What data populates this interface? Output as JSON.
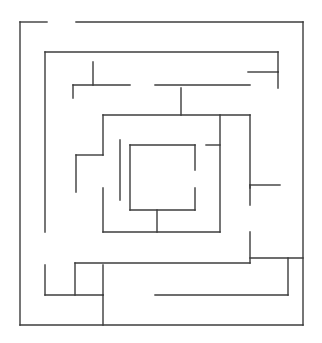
{
  "canvas": {
    "width": 322,
    "height": 343,
    "background_color": "#ffffff"
  },
  "maze": {
    "title": "Square spiral maze",
    "line_color": "#3c3c3c",
    "line_width": 1.4,
    "entrance_gap": {
      "edge": "top",
      "from_x": 47,
      "to_x": 76
    },
    "exit_gap": {
      "edge": "right",
      "from_y": 258,
      "to_y": 283
    },
    "bounds": {
      "left": 20,
      "top": 22,
      "right": 303,
      "bottom": 325
    },
    "ring_count": 5,
    "walls": [
      {
        "id": "outer-top-left",
        "x1": 20,
        "y1": 22,
        "x2": 47,
        "y2": 22
      },
      {
        "id": "outer-top-right",
        "x1": 76,
        "y1": 22,
        "x2": 303,
        "y2": 22
      },
      {
        "id": "outer-left",
        "x1": 20,
        "y1": 22,
        "x2": 20,
        "y2": 325
      },
      {
        "id": "outer-right",
        "x1": 303,
        "y1": 22,
        "x2": 303,
        "y2": 325
      },
      {
        "id": "outer-bottom",
        "x1": 20,
        "y1": 325,
        "x2": 303,
        "y2": 325
      },
      {
        "id": "r1-top",
        "x1": 45,
        "y1": 52,
        "x2": 278,
        "y2": 52
      },
      {
        "id": "r1-left-upper",
        "x1": 45,
        "y1": 52,
        "x2": 45,
        "y2": 232
      },
      {
        "id": "r1-left-lower",
        "x1": 45,
        "y1": 265,
        "x2": 45,
        "y2": 295
      },
      {
        "id": "r1-bottom-left",
        "x1": 45,
        "y1": 295,
        "x2": 103,
        "y2": 295
      },
      {
        "id": "r1-bottom-right",
        "x1": 155,
        "y1": 295,
        "x2": 288,
        "y2": 295
      },
      {
        "id": "r1-right-upper",
        "x1": 278,
        "y1": 52,
        "x2": 278,
        "y2": 72
      },
      {
        "id": "r1-right-stub-h",
        "x1": 248,
        "y1": 72,
        "x2": 278,
        "y2": 72
      },
      {
        "id": "r1-right-stub-v",
        "x1": 278,
        "y1": 72,
        "x2": 278,
        "y2": 88
      },
      {
        "id": "r1-right-mid",
        "x1": 288,
        "y1": 258,
        "x2": 288,
        "y2": 295
      },
      {
        "id": "r1-right-conn",
        "x1": 250,
        "y1": 258,
        "x2": 303,
        "y2": 258
      },
      {
        "id": "r2-top",
        "x1": 73,
        "y1": 85,
        "x2": 130,
        "y2": 85
      },
      {
        "id": "r2-top-stub-v",
        "x1": 93,
        "y1": 62,
        "x2": 93,
        "y2": 85
      },
      {
        "id": "r2-top-left-v",
        "x1": 73,
        "y1": 85,
        "x2": 73,
        "y2": 98
      },
      {
        "id": "r2-top-right",
        "x1": 155,
        "y1": 85,
        "x2": 250,
        "y2": 85
      },
      {
        "id": "r2-upper-h",
        "x1": 103,
        "y1": 115,
        "x2": 250,
        "y2": 115
      },
      {
        "id": "r2-right-v",
        "x1": 250,
        "y1": 115,
        "x2": 250,
        "y2": 188
      },
      {
        "id": "r2-mid-v",
        "x1": 181,
        "y1": 88,
        "x2": 181,
        "y2": 115
      },
      {
        "id": "r2-left-v",
        "x1": 103,
        "y1": 115,
        "x2": 103,
        "y2": 155
      },
      {
        "id": "r2-left-h",
        "x1": 76,
        "y1": 155,
        "x2": 103,
        "y2": 155
      },
      {
        "id": "r2-left-v2",
        "x1": 76,
        "y1": 155,
        "x2": 76,
        "y2": 192
      },
      {
        "id": "r2-left-low-v",
        "x1": 103,
        "y1": 188,
        "x2": 103,
        "y2": 232
      },
      {
        "id": "r2-bottom-h",
        "x1": 75,
        "y1": 263,
        "x2": 250,
        "y2": 263
      },
      {
        "id": "r2-bottom-left-v",
        "x1": 75,
        "y1": 263,
        "x2": 75,
        "y2": 295
      },
      {
        "id": "r2-bottom-right-v",
        "x1": 250,
        "y1": 232,
        "x2": 250,
        "y2": 263
      },
      {
        "id": "r2-ring-bottom",
        "x1": 103,
        "y1": 232,
        "x2": 220,
        "y2": 232
      },
      {
        "id": "r3-left-v",
        "x1": 120,
        "y1": 140,
        "x2": 120,
        "y2": 200
      },
      {
        "id": "r3-right-stub-h",
        "x1": 250,
        "y1": 185,
        "x2": 280,
        "y2": 185
      },
      {
        "id": "r3-right-stub-v",
        "x1": 250,
        "y1": 185,
        "x2": 250,
        "y2": 205
      },
      {
        "id": "r3-inner-h",
        "x1": 206,
        "y1": 145,
        "x2": 220,
        "y2": 145
      },
      {
        "id": "r3-ring-right-v",
        "x1": 220,
        "y1": 115,
        "x2": 220,
        "y2": 232
      },
      {
        "id": "r3-ring-bottom-stub",
        "x1": 157,
        "y1": 210,
        "x2": 157,
        "y2": 232
      },
      {
        "id": "c-top",
        "x1": 130,
        "y1": 145,
        "x2": 195,
        "y2": 145
      },
      {
        "id": "c-left",
        "x1": 130,
        "y1": 145,
        "x2": 130,
        "y2": 210
      },
      {
        "id": "c-bottom",
        "x1": 130,
        "y1": 210,
        "x2": 195,
        "y2": 210
      },
      {
        "id": "c-right-upper",
        "x1": 195,
        "y1": 145,
        "x2": 195,
        "y2": 170
      },
      {
        "id": "c-right-lower",
        "x1": 195,
        "y1": 188,
        "x2": 195,
        "y2": 210
      },
      {
        "id": "b-left-corner-v",
        "x1": 103,
        "y1": 265,
        "x2": 103,
        "y2": 295
      },
      {
        "id": "b-mid-v",
        "x1": 103,
        "y1": 295,
        "x2": 103,
        "y2": 325
      }
    ]
  }
}
